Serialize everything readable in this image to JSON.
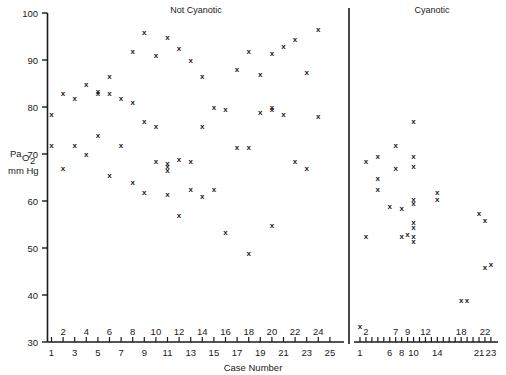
{
  "chart_data": {
    "type": "scatter",
    "title": "",
    "xlabel": "Case Number",
    "ylabel": "Pa O2 mm Hg",
    "ylabel_parts": {
      "main": "Pa",
      "sub": "O",
      "sub2": "2",
      "units": "mm Hg"
    },
    "ylim": [
      30,
      100
    ],
    "yticks": [
      30,
      40,
      50,
      60,
      70,
      80,
      90,
      100
    ],
    "grid": false,
    "legend": "none",
    "marker": "x",
    "panels": [
      {
        "name": "not-cyanotic",
        "label": "Not Cyanotic",
        "xlim": [
          1,
          25
        ],
        "xticks_lower": [
          1,
          3,
          5,
          7,
          9,
          11,
          13,
          15,
          17,
          19,
          21,
          23,
          25
        ],
        "xticks_upper": [
          2,
          4,
          6,
          8,
          10,
          12,
          14,
          16,
          18,
          20,
          22,
          24
        ],
        "points": [
          {
            "case": 1,
            "value": 78.5
          },
          {
            "case": 1,
            "value": 72.0
          },
          {
            "case": 2,
            "value": 83.0
          },
          {
            "case": 2,
            "value": 67.0
          },
          {
            "case": 3,
            "value": 82.0
          },
          {
            "case": 3,
            "value": 72.0
          },
          {
            "case": 4,
            "value": 85.0
          },
          {
            "case": 4,
            "value": 70.0
          },
          {
            "case": 5,
            "value": 83.5
          },
          {
            "case": 5,
            "value": 83.0
          },
          {
            "case": 5,
            "value": 74.0
          },
          {
            "case": 6,
            "value": 86.5
          },
          {
            "case": 6,
            "value": 83.0
          },
          {
            "case": 6,
            "value": 65.5
          },
          {
            "case": 7,
            "value": 82.0
          },
          {
            "case": 7,
            "value": 72.0
          },
          {
            "case": 8,
            "value": 92.0
          },
          {
            "case": 8,
            "value": 81.0
          },
          {
            "case": 8,
            "value": 64.0
          },
          {
            "case": 9,
            "value": 96.0
          },
          {
            "case": 9,
            "value": 77.0
          },
          {
            "case": 9,
            "value": 62.0
          },
          {
            "case": 10,
            "value": 91.0
          },
          {
            "case": 10,
            "value": 76.0
          },
          {
            "case": 10,
            "value": 68.5
          },
          {
            "case": 11,
            "value": 95.0
          },
          {
            "case": 11,
            "value": 68.0
          },
          {
            "case": 11,
            "value": 67.5
          },
          {
            "case": 11,
            "value": 66.5
          },
          {
            "case": 11,
            "value": 61.5
          },
          {
            "case": 12,
            "value": 92.5
          },
          {
            "case": 12,
            "value": 69.0
          },
          {
            "case": 12,
            "value": 57.0
          },
          {
            "case": 13,
            "value": 90.0
          },
          {
            "case": 13,
            "value": 68.5
          },
          {
            "case": 13,
            "value": 62.5
          },
          {
            "case": 14,
            "value": 86.5
          },
          {
            "case": 14,
            "value": 76.0
          },
          {
            "case": 14,
            "value": 61.0
          },
          {
            "case": 15,
            "value": 80.0
          },
          {
            "case": 15,
            "value": 62.5
          },
          {
            "case": 16,
            "value": 79.5
          },
          {
            "case": 16,
            "value": 53.5
          },
          {
            "case": 17,
            "value": 88.0
          },
          {
            "case": 17,
            "value": 71.5
          },
          {
            "case": 18,
            "value": 92.0
          },
          {
            "case": 18,
            "value": 71.5
          },
          {
            "case": 18,
            "value": 49.0
          },
          {
            "case": 19,
            "value": 87.0
          },
          {
            "case": 19,
            "value": 79.0
          },
          {
            "case": 20,
            "value": 91.5
          },
          {
            "case": 20,
            "value": 80.0
          },
          {
            "case": 20,
            "value": 79.5
          },
          {
            "case": 20,
            "value": 55.0
          },
          {
            "case": 21,
            "value": 93.0
          },
          {
            "case": 21,
            "value": 78.5
          },
          {
            "case": 22,
            "value": 94.5
          },
          {
            "case": 22,
            "value": 68.5
          },
          {
            "case": 23,
            "value": 87.5
          },
          {
            "case": 23,
            "value": 67.0
          },
          {
            "case": 24,
            "value": 96.5
          },
          {
            "case": 24,
            "value": 78.0
          }
        ]
      },
      {
        "name": "cyanotic",
        "label": "Cyanotic",
        "xlim": [
          1,
          23
        ],
        "xticks_lower": [
          1,
          6,
          8,
          10,
          14,
          21,
          23
        ],
        "xticks_upper": [
          2,
          7,
          9,
          12,
          18,
          22
        ],
        "points": [
          {
            "case": 1,
            "value": 33.5
          },
          {
            "case": 2,
            "value": 68.5
          },
          {
            "case": 2,
            "value": 52.5
          },
          {
            "case": 4,
            "value": 69.5
          },
          {
            "case": 4,
            "value": 65.0
          },
          {
            "case": 4,
            "value": 62.5
          },
          {
            "case": 6,
            "value": 59.0
          },
          {
            "case": 7,
            "value": 72.0
          },
          {
            "case": 7,
            "value": 67.0
          },
          {
            "case": 8,
            "value": 58.5
          },
          {
            "case": 8,
            "value": 52.5
          },
          {
            "case": 9,
            "value": 53.0
          },
          {
            "case": 10,
            "value": 77.0
          },
          {
            "case": 10,
            "value": 69.5
          },
          {
            "case": 10,
            "value": 67.5
          },
          {
            "case": 10,
            "value": 60.5
          },
          {
            "case": 10,
            "value": 59.5
          },
          {
            "case": 10,
            "value": 55.5
          },
          {
            "case": 10,
            "value": 54.5
          },
          {
            "case": 10,
            "value": 52.5
          },
          {
            "case": 10,
            "value": 51.5
          },
          {
            "case": 14,
            "value": 62.0
          },
          {
            "case": 14,
            "value": 60.5
          },
          {
            "case": 18,
            "value": 39.0
          },
          {
            "case": 19,
            "value": 39.0
          },
          {
            "case": 21,
            "value": 57.5
          },
          {
            "case": 22,
            "value": 56.0
          },
          {
            "case": 22,
            "value": 46.0
          },
          {
            "case": 23,
            "value": 46.5
          }
        ]
      }
    ]
  }
}
